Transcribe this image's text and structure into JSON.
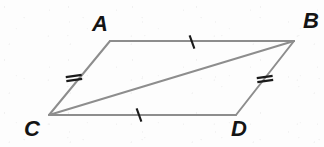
{
  "figure": {
    "name": "parallelogram-with-diagonal",
    "background_color": "#fdfdfd",
    "line_color": "#8d8d8d",
    "tick_color": "#1a1a1a",
    "label_color": "#141414",
    "stroke_width": 2,
    "vertices": [
      {
        "label": "A",
        "x": 110,
        "y": 41,
        "label_x": 92,
        "label_y": 13
      },
      {
        "label": "B",
        "x": 294,
        "y": 41,
        "label_x": 303,
        "label_y": 10
      },
      {
        "label": "C",
        "x": 49,
        "y": 115,
        "label_x": 24,
        "label_y": 118
      },
      {
        "label": "D",
        "x": 236,
        "y": 115,
        "label_x": 231,
        "label_y": 118
      }
    ],
    "edges": [
      {
        "name": "segment-AB",
        "from": "A",
        "to": "B",
        "x1": 110,
        "y1": 41,
        "x2": 294,
        "y2": 41,
        "ticks": 1
      },
      {
        "name": "segment-CD",
        "from": "C",
        "to": "D",
        "x1": 49,
        "y1": 115,
        "x2": 236,
        "y2": 115,
        "ticks": 1
      },
      {
        "name": "segment-CA",
        "from": "C",
        "to": "A",
        "x1": 49,
        "y1": 115,
        "x2": 110,
        "y2": 41,
        "ticks": 2
      },
      {
        "name": "segment-DB",
        "from": "D",
        "to": "B",
        "x1": 236,
        "y1": 115,
        "x2": 294,
        "y2": 41,
        "ticks": 2
      },
      {
        "name": "segment-CB-diagonal",
        "from": "C",
        "to": "B",
        "x1": 49,
        "y1": 115,
        "x2": 294,
        "y2": 41,
        "ticks": 0
      }
    ],
    "tick_marks": [
      {
        "name": "tick-single-AB",
        "on": "segment-AB",
        "count": 1,
        "x": 192,
        "y": 42,
        "angle_deg": 70,
        "length": 14
      },
      {
        "name": "tick-single-CD",
        "on": "segment-CD",
        "count": 1,
        "x": 139,
        "y": 115,
        "angle_deg": 70,
        "length": 14
      },
      {
        "name": "tick-double-CA",
        "on": "segment-CA",
        "count": 2,
        "x": 74,
        "y": 78,
        "angle_deg": 172,
        "length": 16
      },
      {
        "name": "tick-double-DB",
        "on": "segment-DB",
        "count": 2,
        "x": 265,
        "y": 79,
        "angle_deg": 172,
        "length": 16
      }
    ]
  }
}
